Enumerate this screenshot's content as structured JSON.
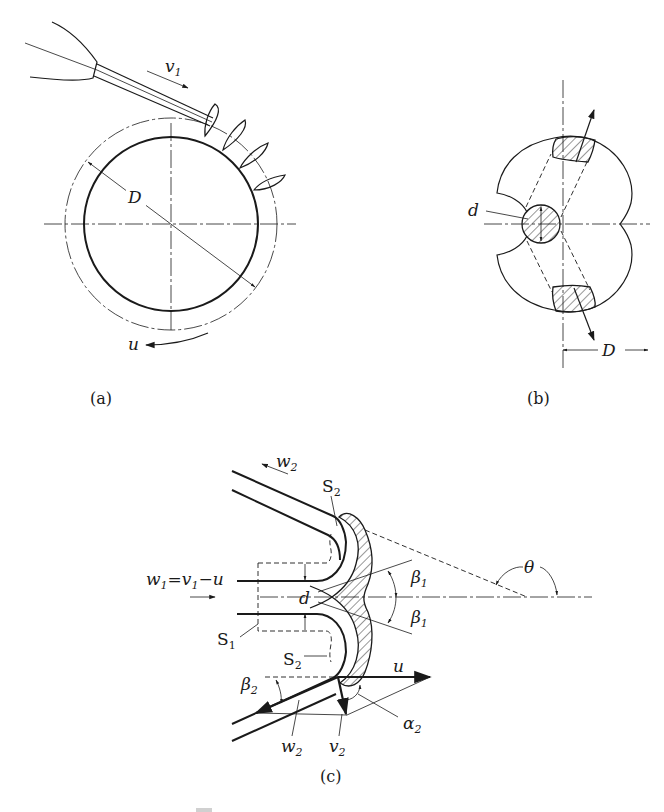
{
  "figure": {
    "panels": [
      {
        "id": "a",
        "caption": "(a)",
        "labels": {
          "velocity_in": "v",
          "velocity_in_sub": "1",
          "diameter": "D",
          "rotation": "u"
        }
      },
      {
        "id": "b",
        "caption": "(b)",
        "labels": {
          "jet_diameter": "d",
          "diameter": "D"
        }
      },
      {
        "id": "c",
        "caption": "(c)",
        "labels": {
          "w2_top": "w",
          "w2_top_sub": "2",
          "s2_top": "S",
          "s2_top_sub": "2",
          "w1_eq": "w",
          "w1_eq_sub": "1",
          "w1_eq_mid": "=v",
          "w1_eq_mid_sub": "1",
          "w1_eq_end": "−u",
          "d": "d",
          "s1": "S",
          "s1_sub": "1",
          "s2_bottom": "S",
          "s2_bottom_sub": "2",
          "beta1_top": "β",
          "beta1_top_sub": "1",
          "beta1_bottom": "β",
          "beta1_bottom_sub": "1",
          "theta": "θ",
          "beta2": "β",
          "beta2_sub": "2",
          "u": "u",
          "alpha2": "α",
          "alpha2_sub": "2",
          "w2_bottom": "w",
          "w2_bottom_sub": "2",
          "v2": "v",
          "v2_sub": "2"
        }
      }
    ],
    "caption_faint": "图"
  }
}
